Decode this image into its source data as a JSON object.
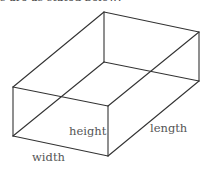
{
  "caption": "s are as stated below:",
  "diagram": {
    "type": "rectangular-prism",
    "labels": {
      "height": "height",
      "length": "length",
      "width": "width"
    },
    "colors": {
      "edge": "#333333",
      "label": "#555555"
    }
  }
}
